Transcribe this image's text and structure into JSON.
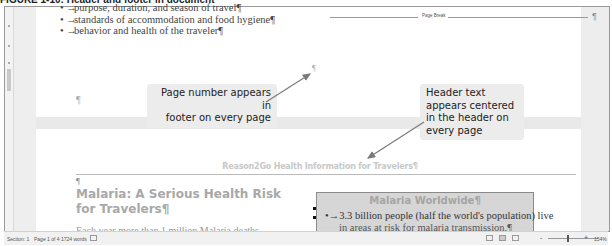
{
  "caption": "FIGURE 1-10: Header and footer in document",
  "page1": {
    "bullets": [
      "purpose, duration, and season of travel¶",
      "standards of accommodation and food hygiene¶",
      "behavior and health of the traveler¶"
    ],
    "bullet_glyph": "•",
    "page_break_label": "Page Break",
    "pilcrow": "¶"
  },
  "callouts": {
    "footer": "Page number appears in footer on every page",
    "footer_lines": [
      "Page number appears in",
      "footer on every page"
    ],
    "header": "Header text appears centered in the header on every page",
    "header_lines": [
      "Header text",
      "appears centered",
      "in the header on",
      "every page"
    ]
  },
  "page2": {
    "header_text": "Reason2Go Health Information for Travelers¶",
    "pilcrow": "¶",
    "heading": "Malaria: A Serious Health Risk for Travelers¶",
    "body_cut": "Each year more than 1 million Malaria deaths",
    "sidebar": {
      "title": "Malaria Worldwide¶",
      "line1": "•→3.3 billion people (half the world's population) live",
      "line2": "in areas at risk for malaria transmission.¶"
    }
  },
  "statusbar": {
    "section": "Section: 1",
    "page": "Page 1 of 4",
    "words": "1724 words",
    "zoom_level": "154%"
  },
  "colors": {
    "callout_bg": "#ececec",
    "header_text": "#c8c8c8",
    "sidebar_bg": "#d6d6d6",
    "arrow": "#7a7a7a"
  }
}
